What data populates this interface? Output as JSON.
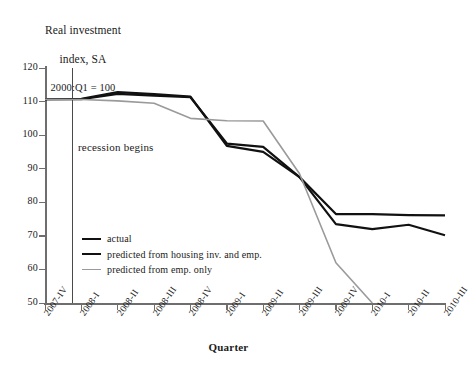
{
  "chart_data": {
    "type": "line",
    "title": "Real investment index, SA 2000:Q1 = 100",
    "title_lines": [
      "Real investment",
      "index, SA",
      "2000:Q1 = 100"
    ],
    "xlabel": "Quarter",
    "ylabel": "Real investment index, SA 2000:Q1 = 100",
    "ylim": [
      50,
      120
    ],
    "yticks": [
      120,
      110,
      100,
      90,
      80,
      70,
      60,
      50
    ],
    "grid": false,
    "legend_position": "lower-left-inside",
    "categories": [
      "2007-IV",
      "2008-I",
      "2008-II",
      "2008-III",
      "2008-IV",
      "2009-I",
      "2009-II",
      "2009-III",
      "2009-IV",
      "2010-I",
      "2010-II",
      "2010-III"
    ],
    "annotations": [
      {
        "text": "recession begins",
        "x_category": "2007-IV",
        "type": "vertical-line-label"
      }
    ],
    "series": [
      {
        "name": "actual",
        "color": "#111111",
        "width": 2.2,
        "values": [
          110.7,
          110.7,
          112.3,
          111.8,
          111.3,
          97.5,
          96.5,
          87.5,
          76.5,
          76.5,
          76.2,
          76.1
        ]
      },
      {
        "name": "predicted from housing inv. and emp.",
        "color": "#111111",
        "width": 2.2,
        "values": [
          110.7,
          110.8,
          112.8,
          112.2,
          111.5,
          96.8,
          95.0,
          87.5,
          73.5,
          72.0,
          73.3,
          70.2
        ]
      },
      {
        "name": "predicted from emp. only",
        "color": "#9a9a9a",
        "width": 1.6,
        "values": [
          110.7,
          110.6,
          110.2,
          109.5,
          105.0,
          104.3,
          104.2,
          88.5,
          62.0,
          50.0,
          null,
          null
        ]
      }
    ]
  },
  "legend": {
    "items": [
      {
        "label": "actual"
      },
      {
        "label": "predicted from housing inv. and emp."
      },
      {
        "label": "predicted from emp. only"
      }
    ]
  }
}
